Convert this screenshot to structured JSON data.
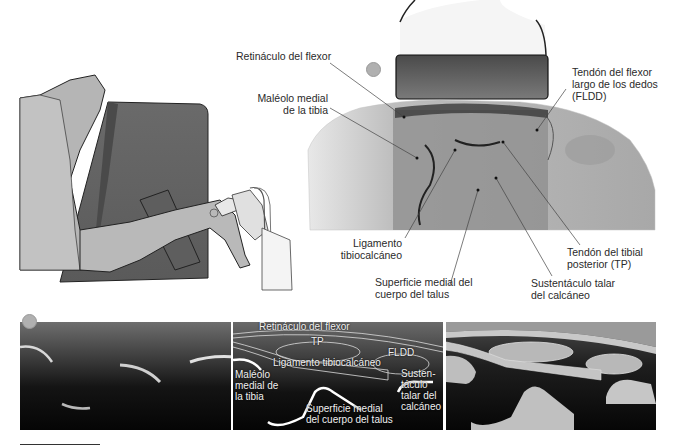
{
  "figure": {
    "type": "medical-ultrasound-figure",
    "top_illustration": {
      "description": "Patient lying on side with ultrasound probe placed on medial ankle",
      "marker_color": "#b0b0b0"
    },
    "cross_section_labels": {
      "retinaculo": "Retináculo del flexor",
      "maleolo_line1": "Maléolo medial",
      "maleolo_line2": "de la tibia",
      "fldd_line1": "Tendón del flexor",
      "fldd_line2": "largo de los dedos",
      "fldd_line3": "(FLDD)",
      "ligamento_line1": "Ligamento",
      "ligamento_line2": "tibiocalcáneo",
      "tp_line1": "Tendón del tibial",
      "tp_line2": "posterior (TP)",
      "superficie_line1": "Superficie medial del",
      "superficie_line2": "cuerpo del talus",
      "sustentaculo_line1": "Sustentáculo talar",
      "sustentaculo_line2": "del calcáneo"
    },
    "ultrasound_panels": {
      "panel1": {
        "name": "raw ultrasound"
      },
      "panel2": {
        "name": "annotated ultrasound",
        "labels": {
          "retinaculo": "Retináculo del flexor",
          "tp": "TP",
          "fldd": "FLDD",
          "ligamento": "Ligamento tibiocalcáneo",
          "maleolo_line1": "Maléolo",
          "maleolo_line2": "medial de",
          "maleolo_line3": "la tibia",
          "sustentaculo_line1": "Susten-",
          "sustentaculo_line2": "táculo",
          "sustentaculo_line3": "talar del",
          "sustentaculo_line4": "calcáneo",
          "superficie_line1": "Superficie medial",
          "superficie_line2": "del cuerpo del talus"
        }
      },
      "panel3": {
        "name": "schematic ultrasound"
      }
    }
  }
}
